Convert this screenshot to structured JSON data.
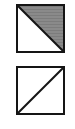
{
  "figure": {
    "background_color": "#ffffff",
    "symbols": [
      {
        "id": "symbol-upper-right-shaded",
        "shape": "square",
        "label": "Square with top-left to bottom-right diagonal, upper-right half shaded gray",
        "border_color": "#151515",
        "border_width_px": 2,
        "size_px": 49,
        "diagonal": {
          "name": "backslash-diagonal",
          "from": "top-left",
          "to": "bottom-right",
          "color": "#151515",
          "width_px": 2
        },
        "halves": [
          {
            "position": "lower-left",
            "fill": "#ffffff",
            "fill_name": "white"
          },
          {
            "position": "upper-right",
            "fill": "#8a8a8a",
            "fill_name": "gray-hatched"
          }
        ]
      },
      {
        "id": "symbol-unfilled",
        "shape": "square",
        "label": "Square with bottom-left to top-right diagonal, both halves white",
        "border_color": "#151515",
        "border_width_px": 2,
        "size_px": 49,
        "diagonal": {
          "name": "forward-slash-diagonal",
          "from": "bottom-left",
          "to": "top-right",
          "color": "#151515",
          "width_px": 2
        },
        "halves": [
          {
            "position": "upper-left",
            "fill": "#ffffff",
            "fill_name": "white"
          },
          {
            "position": "lower-right",
            "fill": "#ffffff",
            "fill_name": "white"
          }
        ]
      }
    ]
  }
}
